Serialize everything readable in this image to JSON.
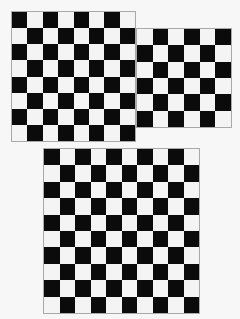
{
  "colors": {
    "dark": "#0b0b0b",
    "light": "#f4f4f4",
    "background": "#f7f7f7",
    "border": "#a9a9a9"
  },
  "boards": [
    {
      "name": "checkerboard-8x8",
      "left": 11,
      "top": 11,
      "width": 125,
      "height": 131,
      "cols": 8,
      "rows": 8,
      "top_left": "dark"
    },
    {
      "name": "checkerboard-6x6",
      "left": 136,
      "top": 28,
      "width": 96,
      "height": 100,
      "cols": 6,
      "rows": 6,
      "top_left": "light"
    },
    {
      "name": "checkerboard-10x10",
      "left": 43,
      "top": 148,
      "width": 157,
      "height": 166,
      "cols": 10,
      "rows": 10,
      "top_left": "dark"
    }
  ]
}
